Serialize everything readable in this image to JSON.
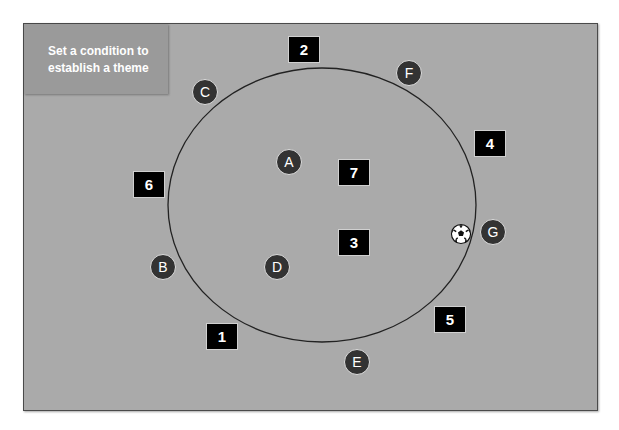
{
  "title_box": {
    "text": "Set a condition to establish a theme"
  },
  "colors": {
    "field": "#aaaaaa",
    "label_box": "#9a9a9a",
    "zone_box": "#000000",
    "player_fill": "#333333",
    "ring": "#222222"
  },
  "ring": {
    "cx": 322,
    "cy": 205,
    "rx": 154,
    "ry": 137
  },
  "zones": [
    {
      "id": "1",
      "label": "1",
      "x": 206,
      "y": 323
    },
    {
      "id": "2",
      "label": "2",
      "x": 288,
      "y": 36
    },
    {
      "id": "3",
      "label": "3",
      "x": 338,
      "y": 229
    },
    {
      "id": "4",
      "label": "4",
      "x": 474,
      "y": 130
    },
    {
      "id": "5",
      "label": "5",
      "x": 434,
      "y": 306
    },
    {
      "id": "6",
      "label": "6",
      "x": 133,
      "y": 171
    },
    {
      "id": "7",
      "label": "7",
      "x": 338,
      "y": 159
    }
  ],
  "players": [
    {
      "label": "A",
      "x": 289,
      "y": 162
    },
    {
      "label": "B",
      "x": 163,
      "y": 267
    },
    {
      "label": "C",
      "x": 205,
      "y": 92
    },
    {
      "label": "D",
      "x": 277,
      "y": 267
    },
    {
      "label": "E",
      "x": 357,
      "y": 362
    },
    {
      "label": "F",
      "x": 409,
      "y": 73
    },
    {
      "label": "G",
      "x": 493,
      "y": 232
    }
  ],
  "ball": {
    "icon": "soccer-ball-icon",
    "x": 461,
    "y": 234
  }
}
